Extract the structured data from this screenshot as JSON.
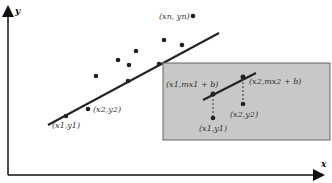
{
  "diagram": {
    "type": "linear-regression-illustration",
    "axes": {
      "x_label": "x",
      "y_label": "y"
    },
    "main_plot": {
      "point_labels": {
        "first": "(x1,y1)",
        "second": "(x2,y2)",
        "last": "(xn, yn)"
      },
      "data_point_count": 11
    },
    "inset": {
      "background": "#c8c8c8",
      "labels": {
        "predicted_1": "(x1,mx1 + b)",
        "predicted_2": "(x2,mx2 + b)",
        "observed_1": "(x1,y1)",
        "observed_2": "(x2,y2)"
      }
    }
  }
}
